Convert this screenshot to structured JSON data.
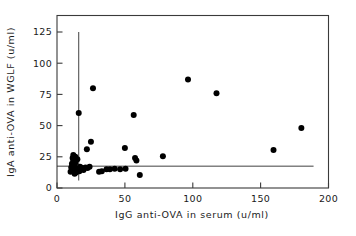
{
  "chart_data": {
    "type": "scatter",
    "title": "",
    "xlabel": "IgG anti-OVA in serum (u/ml)",
    "ylabel": "IgA anti-OVA in WGLF (u/ml)",
    "xlim": [
      0,
      200
    ],
    "ylim": [
      0,
      130
    ],
    "xticks": [
      0,
      50,
      100,
      150,
      200
    ],
    "yticks": [
      0,
      25,
      50,
      75,
      100,
      125
    ],
    "xtick_labels": [
      "0",
      "50",
      "100",
      "150",
      "200"
    ],
    "ytick_labels": [
      "0",
      "25",
      "50",
      "75",
      "100",
      "125"
    ],
    "grid": false,
    "legend": null,
    "marker": "filled-circle",
    "marker_color": "#000000",
    "points": [
      {
        "x": 10.0,
        "y": 13.0
      },
      {
        "x": 10.5,
        "y": 16.5
      },
      {
        "x": 11.0,
        "y": 19.5
      },
      {
        "x": 11.5,
        "y": 24.0
      },
      {
        "x": 12.0,
        "y": 26.5
      },
      {
        "x": 12.0,
        "y": 22.0
      },
      {
        "x": 12.5,
        "y": 17.5
      },
      {
        "x": 12.5,
        "y": 14.0
      },
      {
        "x": 13.0,
        "y": 11.5
      },
      {
        "x": 13.5,
        "y": 25.0
      },
      {
        "x": 13.5,
        "y": 20.0
      },
      {
        "x": 14.0,
        "y": 16.0
      },
      {
        "x": 14.0,
        "y": 12.5
      },
      {
        "x": 15.0,
        "y": 23.0
      },
      {
        "x": 15.5,
        "y": 15.0
      },
      {
        "x": 16.0,
        "y": 60.0
      },
      {
        "x": 16.5,
        "y": 13.5
      },
      {
        "x": 17.0,
        "y": 17.0
      },
      {
        "x": 18.5,
        "y": 16.0
      },
      {
        "x": 19.5,
        "y": 14.5
      },
      {
        "x": 21.0,
        "y": 16.5
      },
      {
        "x": 22.0,
        "y": 31.0
      },
      {
        "x": 22.5,
        "y": 16.0
      },
      {
        "x": 24.0,
        "y": 17.0
      },
      {
        "x": 25.0,
        "y": 37.0
      },
      {
        "x": 26.5,
        "y": 80.0
      },
      {
        "x": 31.0,
        "y": 13.0
      },
      {
        "x": 33.0,
        "y": 13.5
      },
      {
        "x": 36.5,
        "y": 15.0
      },
      {
        "x": 39.0,
        "y": 15.0
      },
      {
        "x": 42.5,
        "y": 15.5
      },
      {
        "x": 46.5,
        "y": 15.0
      },
      {
        "x": 50.0,
        "y": 32.0
      },
      {
        "x": 50.5,
        "y": 15.5
      },
      {
        "x": 56.5,
        "y": 58.5
      },
      {
        "x": 57.5,
        "y": 24.0
      },
      {
        "x": 58.5,
        "y": 22.0
      },
      {
        "x": 61.0,
        "y": 10.5
      },
      {
        "x": 78.0,
        "y": 25.5
      },
      {
        "x": 96.5,
        "y": 87.0
      },
      {
        "x": 117.5,
        "y": 76.0
      },
      {
        "x": 159.5,
        "y": 30.5
      },
      {
        "x": 180.0,
        "y": 48.0
      }
    ],
    "reference_lines": [
      {
        "orientation": "horizontal",
        "value": 17.5,
        "x_from": 0,
        "x_to": 189
      },
      {
        "orientation": "vertical",
        "value": 16.0,
        "y_from": 6,
        "y_to": 125
      }
    ]
  }
}
